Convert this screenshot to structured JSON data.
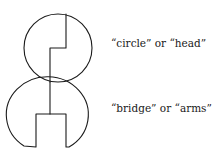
{
  "diagram": {
    "type": "figure-decomposition",
    "stroke_color": "#1a1a1a",
    "parts": [
      {
        "id": "head",
        "shape": "circle with stepped dividing line",
        "label": "“circle” or “head”"
      },
      {
        "id": "arms",
        "shape": "circle with rectangular notch cut from bottom and vertical stem",
        "label": "“bridge” or “arms”"
      }
    ]
  }
}
